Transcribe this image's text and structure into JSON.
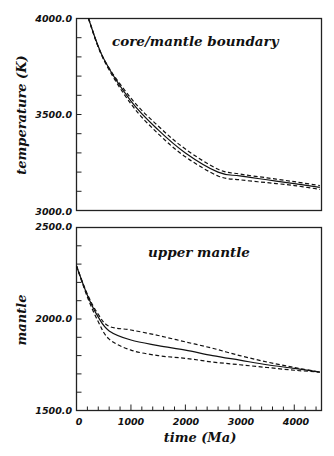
{
  "chart_data": [
    {
      "type": "line",
      "title": "core/mantle boundary",
      "xlabel": "",
      "ylabel": "temperature (K)",
      "xlim": [
        0,
        4500
      ],
      "ylim": [
        3000.0,
        4000.0
      ],
      "y_tick_labels": [
        "4000.0",
        "3500.0",
        "3000.0"
      ],
      "grid": false,
      "series": [
        {
          "name": "model (solid)",
          "style": "solid",
          "x": [
            220,
            500,
            1000,
            1500,
            2000,
            2600,
            3000,
            3500,
            4000,
            4470
          ],
          "y": [
            4000,
            3790,
            3570,
            3420,
            3300,
            3200,
            3180,
            3160,
            3140,
            3120
          ]
        },
        {
          "name": "upper bound (dashed)",
          "style": "dashed",
          "x": [
            220,
            500,
            1000,
            1500,
            2000,
            2600,
            3000,
            3500,
            4000,
            4470
          ],
          "y": [
            4000,
            3790,
            3585,
            3440,
            3320,
            3215,
            3190,
            3170,
            3150,
            3130
          ]
        },
        {
          "name": "lower bound (dashed)",
          "style": "dashed",
          "x": [
            220,
            500,
            1000,
            1500,
            2000,
            2600,
            3000,
            3500,
            4000,
            4470
          ],
          "y": [
            4000,
            3785,
            3555,
            3400,
            3280,
            3180,
            3160,
            3145,
            3130,
            3110
          ]
        }
      ]
    },
    {
      "type": "line",
      "title": "upper mantle",
      "xlabel": "time (Ma)",
      "ylabel": "mantle",
      "xlim": [
        0,
        4500
      ],
      "ylim": [
        1500.0,
        2500.0
      ],
      "x_tick_labels": [
        "0",
        "1000",
        "2000",
        "3000",
        "4000"
      ],
      "y_tick_labels": [
        "2500.0",
        "2000.0",
        "1500.0"
      ],
      "grid": false,
      "series": [
        {
          "name": "model (solid)",
          "style": "solid",
          "x": [
            0,
            200,
            400,
            600,
            1000,
            1500,
            2000,
            2500,
            3000,
            3500,
            4000,
            4470
          ],
          "y": [
            2290,
            2130,
            2010,
            1935,
            1885,
            1855,
            1830,
            1800,
            1775,
            1750,
            1730,
            1710
          ]
        },
        {
          "name": "upper bound (dashed)",
          "style": "dashed",
          "x": [
            0,
            200,
            400,
            600,
            1000,
            1500,
            2000,
            2500,
            3000,
            3500,
            4000,
            4470
          ],
          "y": [
            2290,
            2135,
            2025,
            1960,
            1940,
            1910,
            1875,
            1840,
            1800,
            1765,
            1735,
            1710
          ]
        },
        {
          "name": "lower bound (dashed)",
          "style": "dashed",
          "x": [
            0,
            200,
            400,
            600,
            1000,
            1500,
            2000,
            2500,
            3000,
            3500,
            4000,
            4470
          ],
          "y": [
            2290,
            2120,
            1985,
            1890,
            1830,
            1800,
            1785,
            1765,
            1750,
            1735,
            1720,
            1710
          ]
        }
      ]
    }
  ],
  "labels": {
    "top_title": "core/mantle boundary",
    "top_ylabel": "temperature (K)",
    "top_y_max": "4000.0",
    "top_y_mid": "3500.0",
    "top_y_min": "3000.0",
    "bottom_title": "upper mantle",
    "bottom_ylabel": "mantle",
    "bottom_y_max": "2500.0",
    "bottom_y_mid": "2000.0",
    "bottom_y_min": "1500.0",
    "x_ticks": [
      "0",
      "1000",
      "2000",
      "3000",
      "4000"
    ],
    "xlabel": "time (Ma)"
  }
}
